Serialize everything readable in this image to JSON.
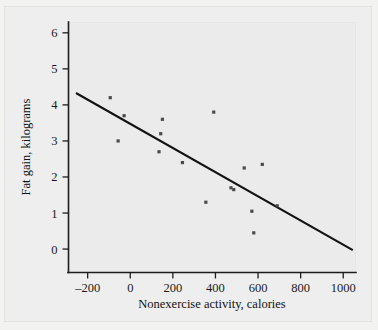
{
  "chart_data": {
    "type": "scatter",
    "title": "",
    "xlabel": "Nonexercise activity, calories",
    "ylabel": "Fat gain, kilograms",
    "xlim": [
      -290,
      1060
    ],
    "ylim": [
      -0.65,
      6.3
    ],
    "xticks": [
      -200,
      0,
      200,
      400,
      600,
      800,
      1000
    ],
    "xticklabels": [
      "-200",
      "0",
      "200",
      "400",
      "600",
      "800",
      "1000"
    ],
    "yticks": [
      0,
      1,
      2,
      3,
      4,
      5,
      6
    ],
    "yticklabels": [
      "0",
      "1",
      "2",
      "3",
      "4",
      "5",
      "6"
    ],
    "grid": false,
    "legend": false,
    "marker_color": "#4a4a4a",
    "line_color": "#121212",
    "background_color": "#ebebeb",
    "x": [
      -94,
      -57,
      -29,
      135,
      143,
      151,
      245,
      355,
      392,
      473,
      486,
      535,
      571,
      580,
      620,
      690
    ],
    "y": [
      4.2,
      3.0,
      3.7,
      2.7,
      3.2,
      3.6,
      2.4,
      1.3,
      3.8,
      1.7,
      1.65,
      2.25,
      1.05,
      0.45,
      2.35,
      1.2
    ],
    "points": [
      {
        "x": -94,
        "y": 4.2
      },
      {
        "x": -57,
        "y": 3.0
      },
      {
        "x": -29,
        "y": 3.7
      },
      {
        "x": 135,
        "y": 2.7
      },
      {
        "x": 143,
        "y": 3.2
      },
      {
        "x": 151,
        "y": 3.6
      },
      {
        "x": 245,
        "y": 2.4
      },
      {
        "x": 355,
        "y": 1.3
      },
      {
        "x": 392,
        "y": 3.8
      },
      {
        "x": 473,
        "y": 1.7
      },
      {
        "x": 486,
        "y": 1.65
      },
      {
        "x": 535,
        "y": 2.25
      },
      {
        "x": 571,
        "y": 1.05
      },
      {
        "x": 580,
        "y": 0.45
      },
      {
        "x": 620,
        "y": 2.35
      },
      {
        "x": 690,
        "y": 1.2
      }
    ],
    "fit_line": {
      "type": "linear-regression",
      "x_start": -255,
      "y_start": 4.33,
      "x_end": 1045,
      "y_end": -0.03
    }
  }
}
